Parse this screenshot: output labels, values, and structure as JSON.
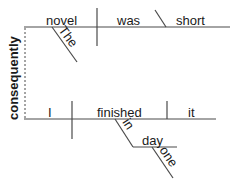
{
  "diagram": {
    "type": "sentence-diagram (Reed-Kellogg)",
    "sentence_clauses": [
      {
        "subject": "novel",
        "subject_modifier": "The",
        "verb": "was",
        "predicate_adjective": "short"
      },
      {
        "subject": "I",
        "verb": "finished",
        "direct_object": "it",
        "prepositional_phrase": {
          "preposition": "in",
          "object": "day",
          "object_modifier": "one"
        }
      }
    ],
    "connector": "consequently",
    "words": {
      "novel": "novel",
      "the": "The",
      "was": "was",
      "short": "short",
      "consequently": "consequently",
      "i": "I",
      "finished": "finished",
      "it": "it",
      "in": "in",
      "day": "day",
      "one": "one"
    },
    "colors": {
      "line": "#4a4a4a",
      "text": "#1a1a1a",
      "background": "#ffffff"
    }
  }
}
